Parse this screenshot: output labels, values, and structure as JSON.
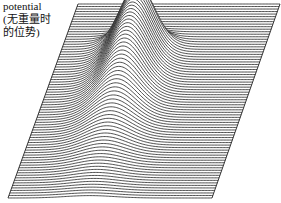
{
  "label": {
    "line1": "potential",
    "line2": "(无重量时",
    "line3": "的位势)"
  },
  "chart_data": {
    "type": "surface-wireframe",
    "title": "",
    "plane": {
      "top_left": [
        78,
        4
      ],
      "top_right": [
        280,
        4
      ],
      "bottom_left": [
        8,
        198
      ],
      "bottom_right": [
        212,
        198
      ]
    },
    "line_count": 78,
    "peak": {
      "center_u": 0.36,
      "center_v": 0.22,
      "height_px": 62,
      "width_u": 0.075,
      "depth_extent_v": 0.68
    },
    "colors": {
      "line": "#222222",
      "background": "#ffffff"
    }
  }
}
